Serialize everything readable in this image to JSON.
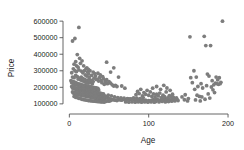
{
  "chart_data": {
    "type": "scatter",
    "title": "",
    "xlabel": "Age",
    "ylabel": "Price",
    "xlim": [
      -8,
      205
    ],
    "ylim": [
      75000,
      625000
    ],
    "xticks": [
      0,
      100,
      200
    ],
    "xticklabels": [
      "0",
      "100",
      "200"
    ],
    "yticks": [
      100000,
      200000,
      300000,
      400000,
      500000,
      600000
    ],
    "yticklabels": [
      "100000",
      "200000",
      "300000",
      "400000",
      "500000",
      "600000"
    ],
    "grid": false,
    "legend": null,
    "marker_color": "#7d7d7d",
    "marker_size": 1.9,
    "points": [
      [
        4,
        480000
      ],
      [
        7,
        495000
      ],
      [
        12,
        562000
      ],
      [
        10,
        398000
      ],
      [
        13,
        375000
      ],
      [
        8,
        355000
      ],
      [
        6,
        340000
      ],
      [
        9,
        330000
      ],
      [
        11,
        322000
      ],
      [
        14,
        345000
      ],
      [
        16,
        360000
      ],
      [
        18,
        330000
      ],
      [
        5,
        312000
      ],
      [
        7,
        300000
      ],
      [
        9,
        295000
      ],
      [
        12,
        305000
      ],
      [
        15,
        298000
      ],
      [
        17,
        288000
      ],
      [
        19,
        300000
      ],
      [
        21,
        312000
      ],
      [
        23,
        292000
      ],
      [
        20,
        275000
      ],
      [
        22,
        268000
      ],
      [
        24,
        282000
      ],
      [
        3,
        288000
      ],
      [
        4,
        262000
      ],
      [
        6,
        258000
      ],
      [
        8,
        272000
      ],
      [
        10,
        265000
      ],
      [
        11,
        250000
      ],
      [
        13,
        256000
      ],
      [
        14,
        245000
      ],
      [
        15,
        262000
      ],
      [
        16,
        240000
      ],
      [
        17,
        252000
      ],
      [
        18,
        238000
      ],
      [
        19,
        248000
      ],
      [
        20,
        232000
      ],
      [
        21,
        244000
      ],
      [
        22,
        228000
      ],
      [
        23,
        240000
      ],
      [
        24,
        226000
      ],
      [
        25,
        250000
      ],
      [
        26,
        238000
      ],
      [
        27,
        228000
      ],
      [
        28,
        242000
      ],
      [
        29,
        222000
      ],
      [
        30,
        235000
      ],
      [
        2,
        240000
      ],
      [
        3,
        228000
      ],
      [
        4,
        236000
      ],
      [
        5,
        222000
      ],
      [
        6,
        232000
      ],
      [
        7,
        218000
      ],
      [
        8,
        228000
      ],
      [
        9,
        215000
      ],
      [
        10,
        224000
      ],
      [
        11,
        212000
      ],
      [
        12,
        220000
      ],
      [
        13,
        208000
      ],
      [
        14,
        218000
      ],
      [
        15,
        206000
      ],
      [
        16,
        214000
      ],
      [
        17,
        204000
      ],
      [
        18,
        212000
      ],
      [
        19,
        202000
      ],
      [
        20,
        210000
      ],
      [
        21,
        200000
      ],
      [
        22,
        208000
      ],
      [
        23,
        198000
      ],
      [
        24,
        206000
      ],
      [
        25,
        196000
      ],
      [
        26,
        204000
      ],
      [
        27,
        194000
      ],
      [
        28,
        202000
      ],
      [
        29,
        192000
      ],
      [
        30,
        200000
      ],
      [
        31,
        190000
      ],
      [
        32,
        198000
      ],
      [
        33,
        188000
      ],
      [
        34,
        196000
      ],
      [
        35,
        186000
      ],
      [
        36,
        194000
      ],
      [
        37,
        184000
      ],
      [
        3,
        205000
      ],
      [
        4,
        196000
      ],
      [
        5,
        202000
      ],
      [
        6,
        192000
      ],
      [
        7,
        198000
      ],
      [
        8,
        188000
      ],
      [
        9,
        195000
      ],
      [
        10,
        186000
      ],
      [
        11,
        192000
      ],
      [
        12,
        182000
      ],
      [
        13,
        190000
      ],
      [
        14,
        180000
      ],
      [
        15,
        188000
      ],
      [
        16,
        178000
      ],
      [
        17,
        186000
      ],
      [
        18,
        176000
      ],
      [
        19,
        184000
      ],
      [
        20,
        174000
      ],
      [
        21,
        182000
      ],
      [
        22,
        172000
      ],
      [
        23,
        180000
      ],
      [
        24,
        170000
      ],
      [
        25,
        178000
      ],
      [
        26,
        168000
      ],
      [
        27,
        176000
      ],
      [
        28,
        166000
      ],
      [
        29,
        174000
      ],
      [
        30,
        164000
      ],
      [
        31,
        172000
      ],
      [
        32,
        162000
      ],
      [
        33,
        170000
      ],
      [
        34,
        160000
      ],
      [
        35,
        168000
      ],
      [
        36,
        158000
      ],
      [
        37,
        166000
      ],
      [
        38,
        156000
      ],
      [
        39,
        164000
      ],
      [
        40,
        154000
      ],
      [
        41,
        162000
      ],
      [
        42,
        152000
      ],
      [
        43,
        160000
      ],
      [
        44,
        150000
      ],
      [
        4,
        172000
      ],
      [
        5,
        165000
      ],
      [
        6,
        170000
      ],
      [
        7,
        160000
      ],
      [
        8,
        168000
      ],
      [
        9,
        158000
      ],
      [
        10,
        166000
      ],
      [
        11,
        156000
      ],
      [
        12,
        164000
      ],
      [
        13,
        154000
      ],
      [
        14,
        162000
      ],
      [
        15,
        152000
      ],
      [
        16,
        160000
      ],
      [
        17,
        150000
      ],
      [
        18,
        158000
      ],
      [
        19,
        148000
      ],
      [
        20,
        156000
      ],
      [
        21,
        146000
      ],
      [
        22,
        154000
      ],
      [
        23,
        144000
      ],
      [
        24,
        152000
      ],
      [
        25,
        142000
      ],
      [
        26,
        150000
      ],
      [
        27,
        140000
      ],
      [
        28,
        148000
      ],
      [
        29,
        138000
      ],
      [
        30,
        146000
      ],
      [
        31,
        136000
      ],
      [
        32,
        144000
      ],
      [
        33,
        134000
      ],
      [
        34,
        142000
      ],
      [
        35,
        132000
      ],
      [
        36,
        140000
      ],
      [
        37,
        130000
      ],
      [
        38,
        138000
      ],
      [
        39,
        128000
      ],
      [
        40,
        136000
      ],
      [
        41,
        126000
      ],
      [
        42,
        134000
      ],
      [
        43,
        124000
      ],
      [
        44,
        132000
      ],
      [
        45,
        122000
      ],
      [
        6,
        145000
      ],
      [
        8,
        140000
      ],
      [
        10,
        138000
      ],
      [
        12,
        134000
      ],
      [
        14,
        132000
      ],
      [
        16,
        128000
      ],
      [
        18,
        126000
      ],
      [
        20,
        124000
      ],
      [
        22,
        122000
      ],
      [
        24,
        120000
      ],
      [
        26,
        119000
      ],
      [
        28,
        118000
      ],
      [
        30,
        117000
      ],
      [
        32,
        116000
      ],
      [
        34,
        115000
      ],
      [
        36,
        114000
      ],
      [
        38,
        113000
      ],
      [
        40,
        112000
      ],
      [
        42,
        112000
      ],
      [
        44,
        111000
      ],
      [
        46,
        115000
      ],
      [
        48,
        118000
      ],
      [
        50,
        116000
      ],
      [
        52,
        120000
      ],
      [
        25,
        262000
      ],
      [
        28,
        272000
      ],
      [
        31,
        255000
      ],
      [
        33,
        268000
      ],
      [
        35,
        248000
      ],
      [
        38,
        258000
      ],
      [
        40,
        242000
      ],
      [
        43,
        252000
      ],
      [
        45,
        238000
      ],
      [
        47,
        246000
      ],
      [
        36,
        285000
      ],
      [
        39,
        275000
      ],
      [
        42,
        265000
      ],
      [
        30,
        292000
      ],
      [
        26,
        300000
      ],
      [
        32,
        282000
      ],
      [
        22,
        318000
      ],
      [
        24,
        308000
      ],
      [
        50,
        235000
      ],
      [
        52,
        225000
      ],
      [
        46,
        230000
      ],
      [
        48,
        222000
      ],
      [
        54,
        215000
      ],
      [
        56,
        208000
      ],
      [
        58,
        212000
      ],
      [
        60,
        205000
      ],
      [
        44,
        218000
      ],
      [
        41,
        228000
      ],
      [
        37,
        238000
      ],
      [
        34,
        248000
      ],
      [
        47,
        352000
      ],
      [
        56,
        318000
      ],
      [
        62,
        262000
      ],
      [
        66,
        208000
      ],
      [
        70,
        195000
      ],
      [
        52,
        292000
      ],
      [
        46,
        145000
      ],
      [
        48,
        138000
      ],
      [
        50,
        132000
      ],
      [
        52,
        128000
      ],
      [
        54,
        126000
      ],
      [
        56,
        124000
      ],
      [
        58,
        122000
      ],
      [
        60,
        120000
      ],
      [
        62,
        126000
      ],
      [
        64,
        124000
      ],
      [
        66,
        122000
      ],
      [
        68,
        128000
      ],
      [
        70,
        126000
      ],
      [
        72,
        124000
      ],
      [
        74,
        130000
      ],
      [
        76,
        128000
      ],
      [
        78,
        126000
      ],
      [
        80,
        132000
      ],
      [
        49,
        152000
      ],
      [
        53,
        148000
      ],
      [
        57,
        142000
      ],
      [
        61,
        138000
      ],
      [
        65,
        136000
      ],
      [
        69,
        134000
      ],
      [
        73,
        132000
      ],
      [
        77,
        130000
      ],
      [
        81,
        136000
      ],
      [
        85,
        134000
      ],
      [
        89,
        132000
      ],
      [
        93,
        138000
      ],
      [
        82,
        124000
      ],
      [
        84,
        128000
      ],
      [
        86,
        122000
      ],
      [
        88,
        126000
      ],
      [
        90,
        120000
      ],
      [
        92,
        124000
      ],
      [
        94,
        118000
      ],
      [
        96,
        122000
      ],
      [
        98,
        116000
      ],
      [
        100,
        120000
      ],
      [
        102,
        118000
      ],
      [
        104,
        122000
      ],
      [
        84,
        155000
      ],
      [
        88,
        162000
      ],
      [
        92,
        148000
      ],
      [
        96,
        158000
      ],
      [
        100,
        152000
      ],
      [
        104,
        145000
      ],
      [
        86,
        175000
      ],
      [
        94,
        168000
      ],
      [
        102,
        172000
      ],
      [
        106,
        160000
      ],
      [
        98,
        182000
      ],
      [
        90,
        188000
      ],
      [
        106,
        126000
      ],
      [
        108,
        122000
      ],
      [
        110,
        128000
      ],
      [
        112,
        124000
      ],
      [
        114,
        120000
      ],
      [
        116,
        126000
      ],
      [
        118,
        122000
      ],
      [
        120,
        128000
      ],
      [
        122,
        124000
      ],
      [
        124,
        120000
      ],
      [
        126,
        126000
      ],
      [
        128,
        122000
      ],
      [
        108,
        142000
      ],
      [
        112,
        148000
      ],
      [
        116,
        138000
      ],
      [
        120,
        144000
      ],
      [
        124,
        136000
      ],
      [
        128,
        142000
      ],
      [
        110,
        158000
      ],
      [
        114,
        165000
      ],
      [
        118,
        152000
      ],
      [
        122,
        172000
      ],
      [
        126,
        150000
      ],
      [
        130,
        158000
      ],
      [
        105,
        195000
      ],
      [
        110,
        205000
      ],
      [
        115,
        188000
      ],
      [
        119,
        212000
      ],
      [
        123,
        196000
      ],
      [
        127,
        182000
      ],
      [
        130,
        128000
      ],
      [
        132,
        124000
      ],
      [
        134,
        130000
      ],
      [
        136,
        126000
      ],
      [
        131,
        140000
      ],
      [
        135,
        136000
      ],
      [
        133,
        118000
      ],
      [
        137,
        120000
      ],
      [
        129,
        116000
      ],
      [
        125,
        114000
      ],
      [
        121,
        112000
      ],
      [
        117,
        115000
      ],
      [
        113,
        112000
      ],
      [
        109,
        114000
      ],
      [
        107,
        110000
      ],
      [
        103,
        112000
      ],
      [
        99,
        110000
      ],
      [
        95,
        112000
      ],
      [
        91,
        110000
      ],
      [
        87,
        112000
      ],
      [
        83,
        110000
      ],
      [
        79,
        112000
      ],
      [
        75,
        110000
      ],
      [
        71,
        112000
      ],
      [
        142,
        142000
      ],
      [
        146,
        155000
      ],
      [
        150,
        132000
      ],
      [
        152,
        505000
      ],
      [
        155,
        228000
      ],
      [
        158,
        188000
      ],
      [
        160,
        262000
      ],
      [
        162,
        205000
      ],
      [
        164,
        145000
      ],
      [
        166,
        222000
      ],
      [
        168,
        196000
      ],
      [
        170,
        508000
      ],
      [
        172,
        452000
      ],
      [
        174,
        280000
      ],
      [
        176,
        268000
      ],
      [
        178,
        452000
      ],
      [
        180,
        240000
      ],
      [
        182,
        215000
      ],
      [
        184,
        225000
      ],
      [
        186,
        222000
      ],
      [
        188,
        218000
      ],
      [
        190,
        222000
      ],
      [
        193,
        600000
      ],
      [
        175,
        160000
      ],
      [
        181,
        185000
      ],
      [
        183,
        168000
      ],
      [
        177,
        135000
      ],
      [
        171,
        128000
      ],
      [
        165,
        118000
      ],
      [
        159,
        124000
      ],
      [
        153,
        258000
      ],
      [
        157,
        300000
      ],
      [
        161,
        152000
      ],
      [
        167,
        142000
      ],
      [
        173,
        210000
      ],
      [
        179,
        202000
      ],
      [
        185,
        262000
      ],
      [
        187,
        245000
      ],
      [
        189,
        258000
      ],
      [
        191,
        230000
      ],
      [
        145,
        125000
      ],
      [
        149,
        118000
      ]
    ]
  }
}
